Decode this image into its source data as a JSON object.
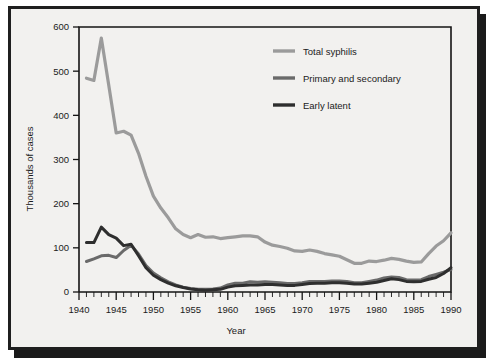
{
  "chart_data": {
    "type": "line",
    "title": "",
    "xlabel": "Year",
    "ylabel": "Thousands of cases",
    "xlim": [
      1940,
      1990
    ],
    "ylim": [
      0,
      600
    ],
    "yticks": [
      0,
      100,
      200,
      300,
      400,
      500,
      600
    ],
    "ytick_labels": [
      "0",
      "100",
      "200",
      "300",
      "400",
      "500",
      "600"
    ],
    "xticks": [
      1940,
      1945,
      1950,
      1955,
      1960,
      1965,
      1970,
      1975,
      1980,
      1985,
      1990
    ],
    "xtick_labels": [
      "1940",
      "1945",
      "1950",
      "1955",
      "1960",
      "1965",
      "1970",
      "1975",
      "1980",
      "1985",
      "1990"
    ],
    "xminor_step": 1,
    "grid": false,
    "legend_position": "upper-right-inside",
    "x": [
      1941,
      1942,
      1943,
      1944,
      1945,
      1946,
      1947,
      1948,
      1949,
      1950,
      1951,
      1952,
      1953,
      1954,
      1955,
      1956,
      1957,
      1958,
      1959,
      1960,
      1961,
      1962,
      1963,
      1964,
      1965,
      1966,
      1967,
      1968,
      1969,
      1970,
      1971,
      1972,
      1973,
      1974,
      1975,
      1976,
      1977,
      1978,
      1979,
      1980,
      1981,
      1982,
      1983,
      1984,
      1985,
      1986,
      1987,
      1988,
      1989,
      1990
    ],
    "series": [
      {
        "name": "Total syphilis",
        "color": "#9b9b9b",
        "width": 3.2,
        "values": [
          484,
          479,
          575,
          468,
          360,
          364,
          355,
          314,
          262,
          217,
          190,
          168,
          143,
          130,
          123,
          130,
          124,
          125,
          121,
          123,
          125,
          127,
          127,
          125,
          113,
          106,
          103,
          99,
          93,
          92,
          95,
          92,
          87,
          84,
          81,
          73,
          65,
          65,
          70,
          69,
          72,
          76,
          74,
          70,
          67,
          68,
          87,
          104,
          116,
          134
        ]
      },
      {
        "name": "Primary and secondary",
        "color": "#6a6a6a",
        "width": 3.0,
        "values": [
          69,
          75,
          82,
          83,
          78,
          94,
          106,
          86,
          60,
          43,
          32,
          23,
          16,
          11,
          8,
          6,
          6,
          7,
          9,
          16,
          20,
          20,
          23,
          22,
          23,
          22,
          21,
          19,
          19,
          21,
          24,
          24,
          24,
          25,
          25,
          24,
          21,
          21,
          24,
          27,
          32,
          34,
          33,
          28,
          27,
          28,
          35,
          40,
          45,
          51
        ]
      },
      {
        "name": "Early latent",
        "color": "#2e2e2e",
        "width": 3.0,
        "values": [
          112,
          112,
          147,
          130,
          122,
          105,
          108,
          82,
          55,
          38,
          28,
          20,
          14,
          10,
          7,
          5,
          4,
          5,
          6,
          11,
          14,
          15,
          16,
          16,
          17,
          17,
          16,
          15,
          15,
          17,
          19,
          20,
          20,
          21,
          21,
          20,
          18,
          18,
          20,
          22,
          26,
          30,
          28,
          24,
          23,
          24,
          29,
          33,
          42,
          55
        ]
      }
    ]
  },
  "legend": {
    "items": [
      {
        "label": "Total syphilis",
        "color": "#9b9b9b"
      },
      {
        "label": "Primary and secondary",
        "color": "#6a6a6a"
      },
      {
        "label": "Early latent",
        "color": "#2e2e2e"
      }
    ]
  }
}
